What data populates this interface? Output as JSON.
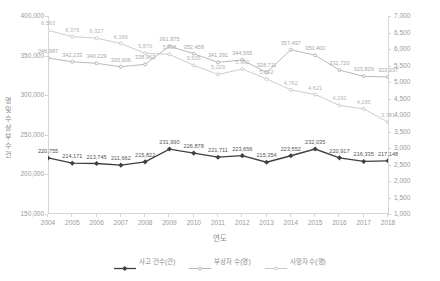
{
  "chart_data": {
    "type": "line",
    "title": "",
    "xlabel": "연도",
    "ylabel_left": "건수 및 부상자 수(명)",
    "ylabel_right": "",
    "grid": false,
    "legend_position": "bottom",
    "categories": [
      "2004",
      "2005",
      "2006",
      "2007",
      "2008",
      "2009",
      "2010",
      "2011",
      "2012",
      "2013",
      "2014",
      "2015",
      "2016",
      "2017",
      "2018"
    ],
    "left_axis": {
      "min": 150000,
      "max": 400000,
      "step": 50000,
      "ticks": [
        "150,000",
        "200,000",
        "250,000",
        "300,000",
        "350,000",
        "400,000"
      ]
    },
    "right_axis": {
      "min": 1000,
      "max": 7000,
      "step": 500,
      "ticks": [
        "1,000",
        "1,500",
        "2,000",
        "2,500",
        "3,000",
        "3,500",
        "4,000",
        "4,500",
        "5,000",
        "5,500",
        "6,000",
        "6,500",
        "7,000"
      ]
    },
    "series": [
      {
        "name": "사고 건수(건)",
        "axis": "left",
        "color": "#3f3f3f",
        "marker": "diamond",
        "values": [
          220755,
          214171,
          213745,
          211662,
          215822,
          231990,
          226878,
          221711,
          223656,
          215354,
          223552,
          232035,
          220917,
          216335,
          217148
        ],
        "labels": [
          "220,755",
          "214,171",
          "213,745",
          "211,662",
          "215,822",
          "231,990",
          "226,878",
          "221,711",
          "223,656",
          "215,354",
          "223,552",
          "232,035",
          "220,917",
          "216,335",
          "217,148"
        ]
      },
      {
        "name": "부상자 수(명)",
        "axis": "left",
        "color": "#a6a6a6",
        "marker": "dash",
        "values": [
          346987,
          342233,
          340229,
          335906,
          338962,
          361875,
          352458,
          341391,
          344565,
          328711,
          357497,
          350400,
          331720,
          323829,
          323037
        ],
        "labels": [
          "346,987",
          "342,233",
          "340,229",
          "335,906",
          "338,962",
          "361,875",
          "352,458",
          "341,391",
          "344,565",
          "328,711",
          "357,497",
          "350,400",
          "331,720",
          "323,829",
          "323,037"
        ]
      },
      {
        "name": "사망자 수(명)",
        "axis": "right",
        "color": "#bfbfbf",
        "marker": "dash",
        "values": [
          6563,
          6376,
          6327,
          6166,
          5870,
          5838,
          5505,
          5229,
          5392,
          5092,
          4762,
          4621,
          4292,
          4185,
          3781
        ],
        "labels": [
          "6,563",
          "6,376",
          "6,327",
          "6,166",
          "5,870",
          "5,838",
          "5,505",
          "5,229",
          "5,392",
          "5,092",
          "4,762",
          "4,621",
          "4,292",
          "4,185",
          "3,781"
        ]
      }
    ]
  },
  "axis": {
    "y_title_chars": [
      "명",
      "및",
      "수",
      "상",
      "부",
      "수",
      "건"
    ],
    "x_title": "연도"
  },
  "legend": {
    "items": [
      {
        "label": "사고 건수(건)",
        "color": "#3f3f3f"
      },
      {
        "label": "부상자 수(명)",
        "color": "#a6a6a6"
      },
      {
        "label": "사망자 수(명)",
        "color": "#bfbfbf"
      }
    ]
  }
}
